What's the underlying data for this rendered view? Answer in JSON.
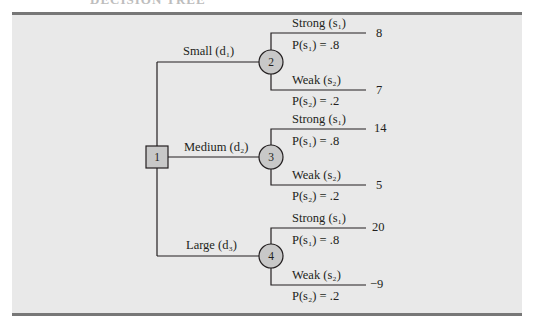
{
  "figure": {
    "header_text": "DECISION TREE",
    "panel_color": "#e9e9e9",
    "node_fill": "#c8c8c8",
    "line_color": "#231f20"
  },
  "tree": {
    "root": {
      "id": "1",
      "type": "decision"
    },
    "decisions": [
      {
        "label": "Small",
        "symbol": "d",
        "sub": "1",
        "chance_node": "2",
        "outcomes": [
          {
            "state": "Strong",
            "symbol": "s",
            "sub": "1",
            "prob_label": "P(s₁) = .8",
            "payoff": "8"
          },
          {
            "state": "Weak",
            "symbol": "s",
            "sub": "2",
            "prob_label": "P(s₂) = .2",
            "payoff": "7"
          }
        ]
      },
      {
        "label": "Medium",
        "symbol": "d",
        "sub": "2",
        "chance_node": "3",
        "outcomes": [
          {
            "state": "Strong",
            "symbol": "s",
            "sub": "1",
            "prob_label": "P(s₁) = .8",
            "payoff": "14"
          },
          {
            "state": "Weak",
            "symbol": "s",
            "sub": "2",
            "prob_label": "P(s₂) = .2",
            "payoff": "5"
          }
        ]
      },
      {
        "label": "Large",
        "symbol": "d",
        "sub": "3",
        "chance_node": "4",
        "outcomes": [
          {
            "state": "Strong",
            "symbol": "s",
            "sub": "1",
            "prob_label": "P(s₁) = .8",
            "payoff": "20"
          },
          {
            "state": "Weak",
            "symbol": "s",
            "sub": "2",
            "prob_label": "P(s₂) = .2",
            "payoff": "−9"
          }
        ]
      }
    ]
  },
  "labels": {
    "d1": "Small (d₁)",
    "d2": "Medium (d₂)",
    "d3": "Large (d₃)",
    "strong1": "Strong (s₁)",
    "weak2": "Weak (s₂)",
    "p1": "P(s₁) = .8",
    "p2": "P(s₂) = .2"
  }
}
